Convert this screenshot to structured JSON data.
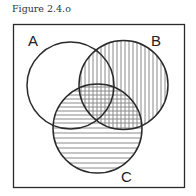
{
  "figure": {
    "caption": "Figure 2.4.o",
    "type": "venn-diagram",
    "sets": [
      {
        "label": "A",
        "shading": "none"
      },
      {
        "label": "B",
        "shading": "vertical-lines"
      },
      {
        "label": "C",
        "shading": "horizontal-lines"
      }
    ],
    "regions_note": "B shaded vertically, C shaded horizontally; B∩C cross-hatched; A only unshaded",
    "colors": {
      "stroke": "#2a2a2a",
      "hatch": "#8a8a8a",
      "background": "#ffffff"
    }
  }
}
